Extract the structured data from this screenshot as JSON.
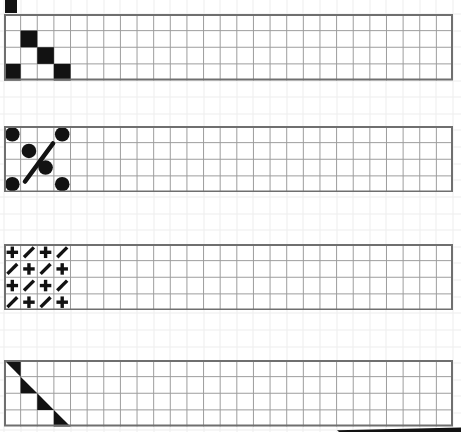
{
  "meta": {
    "width": 461,
    "height": 432
  },
  "colors": {
    "background": "#ffffff",
    "faint_grid": "#ededed",
    "band_border": "#6f6f6f",
    "band_grid": "#9d9d9d",
    "ink": "#121212"
  },
  "grid": {
    "cell_width": 16.63,
    "cell_height": 16.63,
    "offset_x": 3.5,
    "offset_y": 13.5
  },
  "bands": [
    {
      "label": "band-squares-diagonal",
      "x": 4,
      "y": 14,
      "width": 449,
      "height": 66.5,
      "rows": 4,
      "cols": 27,
      "motif": {
        "type": "squares",
        "cells": [
          {
            "r": 1,
            "c": 1
          },
          {
            "r": 2,
            "c": 2
          },
          {
            "r": 3,
            "c": 0
          },
          {
            "r": 3,
            "c": 3
          }
        ]
      }
    },
    {
      "label": "band-circles-slash",
      "x": 4,
      "y": 125.5,
      "width": 449,
      "height": 66.5,
      "rows": 4,
      "cols": 27,
      "motif": {
        "type": "circles",
        "radius": 7.3,
        "cells": [
          {
            "r": 0,
            "c": 0
          },
          {
            "r": 0,
            "c": 3
          },
          {
            "r": 1,
            "c": 1
          },
          {
            "r": 2,
            "c": 2
          },
          {
            "r": 3,
            "c": 0
          },
          {
            "r": 3,
            "c": 3
          }
        ],
        "slash": {
          "x1": 21,
          "y1": 55.5,
          "x2": 49,
          "y2": 17.5,
          "stroke_width": 4.6
        }
      }
    },
    {
      "label": "band-plus-slash-checkerboard",
      "x": 4,
      "y": 243.5,
      "width": 449,
      "height": 66.5,
      "rows": 4,
      "cols": 27,
      "motif": {
        "type": "glyphs",
        "glyph_size": 11.5,
        "stroke_width": 3.4,
        "pattern": [
          [
            "plus",
            "slash",
            "plus",
            "slash"
          ],
          [
            "slash",
            "plus",
            "slash",
            "plus"
          ],
          [
            "plus",
            "slash",
            "plus",
            "slash"
          ],
          [
            "slash",
            "plus",
            "slash",
            "plus"
          ]
        ]
      }
    },
    {
      "label": "band-triangles-diagonal",
      "x": 4,
      "y": 360,
      "width": 449,
      "height": 66.5,
      "rows": 4,
      "cols": 27,
      "motif": {
        "type": "triangles",
        "cells": [
          {
            "r": 0,
            "c": 0,
            "orientation": "upper-right"
          },
          {
            "r": 1,
            "c": 1,
            "orientation": "lower-left"
          },
          {
            "r": 2,
            "c": 2,
            "orientation": "lower-left"
          },
          {
            "r": 3,
            "c": 3,
            "orientation": "lower-left"
          }
        ]
      }
    }
  ],
  "decor": {
    "partial_square_top_left": {
      "x": 4.5,
      "y": 0,
      "width": 12.5,
      "height": 12.5
    },
    "bottom_right_bar": {
      "x": 330,
      "y": 427,
      "width": 131,
      "height": 5,
      "points": [
        [
          7,
          3.2
        ],
        [
          131,
          0.6
        ],
        [
          131,
          5
        ],
        [
          9,
          5
        ]
      ]
    }
  }
}
